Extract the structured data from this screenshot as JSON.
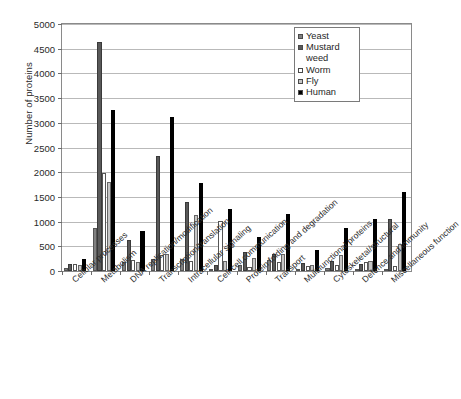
{
  "chart_data": {
    "type": "bar",
    "title": "",
    "xlabel": "",
    "ylabel": "Number of proteins",
    "ylim": [
      0,
      5000
    ],
    "ytick_step": 500,
    "yticks": [
      "0",
      "500",
      "1000",
      "1500",
      "2000",
      "2500",
      "3000",
      "3500",
      "4000",
      "4500",
      "5000"
    ],
    "grid": true,
    "legend_position": "top-right",
    "categories": [
      "Cellular processes",
      "Metabolism",
      "DNA replication/modification",
      "Transcription/translation",
      "Intracellular signaling",
      "Cell-cell communication",
      "Protein folding and degradation",
      "Transport",
      "Multifunctional proteins",
      "Cytoskeletal/structural",
      "Defence and immunity",
      "Miscellaneous function"
    ],
    "series": [
      {
        "name": "Yeast",
        "color": "#808080",
        "values": [
          60,
          875,
          185,
          235,
          240,
          25,
          130,
          215,
          45,
          60,
          45,
          0
        ]
      },
      {
        "name": "Mustard weed",
        "color": "#595959",
        "values": [
          135,
          4630,
          625,
          2325,
          1390,
          120,
          375,
          350,
          155,
          205,
          140,
          1045
        ]
      },
      {
        "name": "Worm",
        "color": "#ffffff",
        "values": [
          135,
          1990,
          215,
          330,
          195,
          1005,
          90,
          175,
          110,
          125,
          185,
          95
        ]
      },
      {
        "name": "Fly",
        "color": "#c6c6c6",
        "values": [
          125,
          1810,
          185,
          340,
          1135,
          195,
          260,
          350,
          115,
          325,
          195,
          540
        ]
      },
      {
        "name": "Human",
        "color": "#000000",
        "values": [
          245,
          3260,
          800,
          3120,
          1775,
          1255,
          690,
          1145,
          420,
          880,
          1055,
          1605
        ]
      }
    ]
  },
  "legend": {
    "entries": [
      {
        "label": "Yeast",
        "icon": "legend-swatch-icon"
      },
      {
        "label": "Mustard weed",
        "icon": "legend-swatch-icon"
      },
      {
        "label": "Worm",
        "icon": "legend-swatch-icon"
      },
      {
        "label": "Fly",
        "icon": "legend-swatch-icon"
      },
      {
        "label": "Human",
        "icon": "legend-swatch-icon"
      }
    ]
  }
}
